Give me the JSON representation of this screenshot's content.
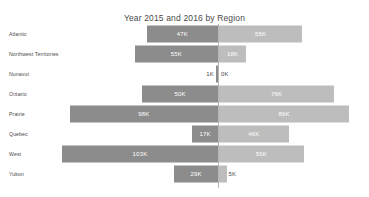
{
  "top_strip": {
    "text": "  ·  ·  ·      ·  ·  ·  ·  ·  ·  ·  ·  ·  ·  · "
  },
  "chart_data": {
    "type": "bar",
    "subtype": "diverging-horizontal-bar",
    "title": "Year 2015 and 2016 by Region",
    "xlabel": "",
    "ylabel": "",
    "grid": false,
    "legend": null,
    "axis_center_value": 0,
    "value_suffix": "K",
    "categories": [
      "Atlantic",
      "Northwest Territories",
      "Nunavut",
      "Ontario",
      "Prairie",
      "Quebec",
      "West",
      "Yukon"
    ],
    "series": [
      {
        "name": "2015",
        "side": "left",
        "color": "#8c8c8c",
        "values": [
          47,
          55,
          1,
          50,
          98,
          17,
          103,
          29
        ],
        "labels": [
          "47K",
          "55K",
          "1K",
          "50K",
          "98K",
          "17K",
          "103K",
          "29K"
        ]
      },
      {
        "name": "2016",
        "side": "right",
        "color": "#bdbdbd",
        "values": [
          55,
          18,
          0,
          76,
          86,
          46,
          56,
          5
        ],
        "labels": [
          "55K",
          "18K",
          "0K",
          "76K",
          "86K",
          "46K",
          "56K",
          "5K"
        ]
      }
    ]
  }
}
